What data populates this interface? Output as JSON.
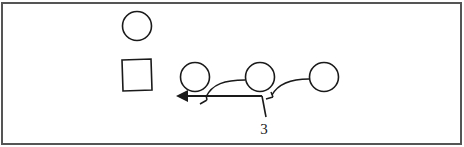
{
  "diagram": {
    "label": "3",
    "colors": {
      "stroke": "#1a1a1a",
      "frame": "#555555",
      "background": "#ffffff"
    },
    "shapes": {
      "top_circle": "circle",
      "square": "square",
      "row_circles": [
        "circle",
        "circle",
        "circle"
      ]
    }
  }
}
